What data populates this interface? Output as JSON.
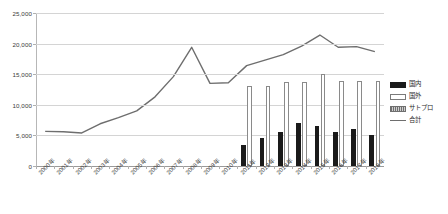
{
  "chart_data": {
    "type": "bar",
    "title": "",
    "subtitle": "",
    "xlabel": "",
    "ylabel": "",
    "ylim": [
      0,
      25000
    ],
    "ytick_values": [
      0,
      5000,
      10000,
      15000,
      20000,
      25000
    ],
    "ytick_labels": [
      "0",
      "5,000",
      "10,000",
      "15,000",
      "20,000",
      "25,000"
    ],
    "grid": true,
    "legend_position": "right",
    "categories": [
      "2000年",
      "2001年",
      "2002年",
      "2003年",
      "2004年",
      "2005年",
      "2006年",
      "2007年",
      "2008年",
      "2009年",
      "2010年",
      "2011年",
      "2012年",
      "2013年",
      "2014年",
      "2015年",
      "2016年",
      "2017年",
      "2018年"
    ],
    "legend_entries": [
      "国内",
      "国外",
      "サトプロ",
      "合計"
    ],
    "series": [
      {
        "name": "国内",
        "type": "bar",
        "marker": "solid-black",
        "values": [
          null,
          null,
          null,
          null,
          null,
          null,
          null,
          null,
          null,
          null,
          null,
          3400,
          4600,
          5500,
          7000,
          6600,
          5500,
          6100,
          5100
        ]
      },
      {
        "name": "国外",
        "type": "bar",
        "marker": "white-outline",
        "values": [
          null,
          null,
          null,
          null,
          null,
          null,
          null,
          null,
          null,
          null,
          null,
          13000,
          13000,
          13700,
          13800,
          15000,
          13900,
          13900,
          13900
        ]
      },
      {
        "name": "サトプロ",
        "type": "bar",
        "marker": "gray-hatch",
        "values": [
          null,
          null,
          null,
          null,
          null,
          null,
          null,
          null,
          null,
          null,
          null,
          null,
          null,
          null,
          null,
          null,
          null,
          null,
          null
        ]
      },
      {
        "name": "合計",
        "type": "line",
        "marker": "gray-line",
        "values": [
          5650,
          5600,
          5400,
          6900,
          7900,
          9000,
          11300,
          14600,
          19400,
          13500,
          13600,
          16400,
          17300,
          18200,
          19600,
          21400,
          19400,
          19500,
          18700
        ]
      }
    ]
  },
  "legend": {
    "items": [
      {
        "label": "国内",
        "key": "solid-black"
      },
      {
        "label": "国外",
        "key": "white-outline"
      },
      {
        "label": "サトプロ",
        "key": "gray-hatch"
      },
      {
        "label": "合計",
        "key": "gray-line"
      }
    ]
  }
}
